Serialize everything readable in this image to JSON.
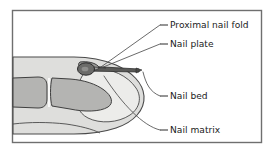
{
  "figure": {
    "frame": {
      "border_color": "#6f6f6f",
      "background_color": "#ffffff",
      "x": 12,
      "y": 10,
      "width": 250,
      "height": 133
    },
    "colors": {
      "soft_tissue_fill": "#dededc",
      "soft_tissue_stroke": "#4a4a4a",
      "bone_fill": "#b4b4b2",
      "bone_stroke": "#3f3f3f",
      "nail_plate_fill": "#5a5a58",
      "nail_plate_stroke": "#2e2e2e",
      "nail_matrix_fill": "#6b6b69",
      "nail_matrix_stroke": "#2a2a2a",
      "nail_bed_fill": "#ececea",
      "leader_line": "#4f4f4f",
      "label_text": "#1b1b1b"
    },
    "structures": [
      {
        "name": "soft-tissue-finger",
        "label": "Finger soft tissue"
      },
      {
        "name": "middle-phalanx-bone",
        "label": "Middle phalanx"
      },
      {
        "name": "distal-phalanx-bone",
        "label": "Distal phalanx"
      },
      {
        "name": "nail-bed-region",
        "label": "Nail bed"
      },
      {
        "name": "nail-plate-wedge",
        "label": "Nail plate"
      },
      {
        "name": "nail-matrix-oval",
        "label": "Nail matrix"
      },
      {
        "name": "proximal-nail-fold-tip",
        "label": "Proximal nail fold"
      }
    ],
    "labels": [
      {
        "id": "proximal-nail-fold",
        "text": "Proximal nail fold",
        "text_x": 170,
        "text_y": 25,
        "dash_x1": 160,
        "dash_x2": 168,
        "leader": "M160,25 L101,67"
      },
      {
        "id": "nail-plate",
        "text": "Nail plate",
        "text_x": 170,
        "text_y": 44,
        "dash_x1": 160,
        "dash_x2": 168,
        "leader": "M160,44 L96,70"
      },
      {
        "id": "nail-bed",
        "text": "Nail bed",
        "text_x": 170,
        "text_y": 96,
        "dash_x1": 160,
        "dash_x2": 168,
        "leader": "M160,96 C150,92 146,84 143,72"
      },
      {
        "id": "nail-matrix",
        "text": "Nail matrix",
        "text_x": 170,
        "text_y": 130,
        "dash_x1": 160,
        "dash_x2": 168,
        "leader": "M160,130 C143,126 122,104 104,76"
      }
    ]
  }
}
